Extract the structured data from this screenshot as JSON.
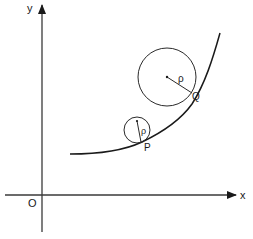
{
  "diagram": {
    "type": "osculating-circles-on-curve",
    "colors": {
      "stroke": "#2a2a2a",
      "background": "#ffffff",
      "text": "#1a1a1a"
    },
    "axes": {
      "x_label": "x",
      "y_label": "y",
      "origin_label": "O"
    },
    "points": [
      {
        "id": "P",
        "label": "P"
      },
      {
        "id": "Q",
        "label": "Q"
      }
    ],
    "circles": [
      {
        "id": "small-circle",
        "at_point": "P",
        "radius_label": "ρ"
      },
      {
        "id": "large-circle",
        "at_point": "Q",
        "radius_label": "ρ"
      }
    ]
  }
}
